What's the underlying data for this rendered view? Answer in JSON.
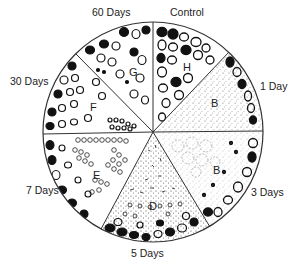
{
  "diagram": {
    "type": "circular sector diagram",
    "center": [
      153,
      132
    ],
    "radius": 110,
    "stroke_color": "#333333",
    "cell_color": "#111111",
    "sectors": [
      {
        "time_label": "Control",
        "letter": "H",
        "pattern": "large cells, partially dark"
      },
      {
        "time_label": "1 Day",
        "letter": "B",
        "pattern": "fine stipple with peripheral dark cells"
      },
      {
        "time_label": "3 Days",
        "letter": "B",
        "pattern": "faint ghost cells with star granules"
      },
      {
        "time_label": "5 Days",
        "letter": "D",
        "pattern": "dense small particles, dark cells at rim"
      },
      {
        "time_label": "7 Days",
        "letter": "E",
        "pattern": "clusters of small round cells"
      },
      {
        "time_label": "30 Days",
        "letter": "F",
        "pattern": "medium cells, dark at rim"
      },
      {
        "time_label": "60 Days",
        "letter": "G",
        "pattern": "large cells, partially dark"
      }
    ]
  },
  "labels": {
    "control": "Control",
    "day1": "1 Day",
    "day3": "3 Days",
    "day5": "5 Days",
    "day7": "7 Days",
    "day30": "30 Days",
    "day60": "60 Days"
  },
  "letters": {
    "h": "H",
    "b1": "B",
    "b3": "B",
    "d": "D",
    "e": "E",
    "f": "F",
    "g": "G"
  }
}
